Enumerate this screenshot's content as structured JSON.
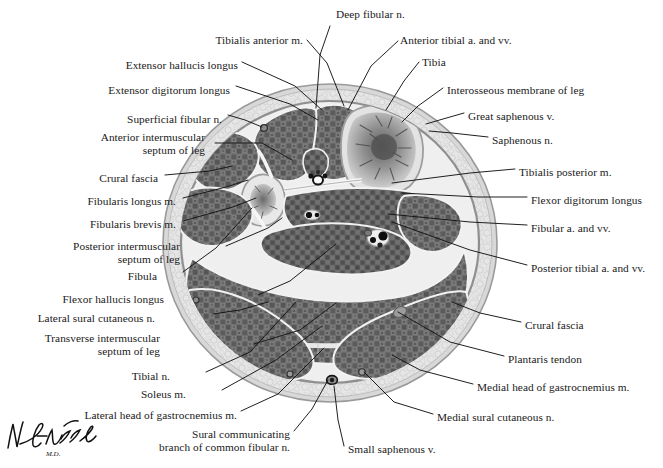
{
  "figure": {
    "credit": "Netter signature",
    "view": "transverse section through middle of right leg",
    "colors": {
      "muscle": "#6d6d6d",
      "muscle_dark": "#4f4f4f",
      "bone_cortex": "#b9b9b9",
      "bone_marrow": "#dadada",
      "marrow_trabecular": "#585858",
      "fascia": "#efefef",
      "subcutaneous": "#e2e2e2",
      "skin": "#cfcfcf",
      "septum": "#f4f4f4",
      "vessel": "#111111",
      "outline": "#6a6a6a",
      "label_text": "#1a1a1a",
      "leader_line": "#111111"
    }
  },
  "labels": [
    {
      "id": "deep-fibular-n",
      "text": "Deep fibular n.",
      "x": 336,
      "y": 8,
      "align": "l"
    },
    {
      "id": "tibialis-anterior-m",
      "text": "Tibialis anterior m.",
      "x": 303,
      "y": 34,
      "align": "r"
    },
    {
      "id": "anterior-tibial-a-vv",
      "text": "Anterior tibial a. and vv.",
      "x": 400,
      "y": 34,
      "align": "l"
    },
    {
      "id": "extensor-hallucis-longus",
      "text": "Extensor hallucis longus",
      "x": 238,
      "y": 59,
      "align": "r"
    },
    {
      "id": "tibia",
      "text": "Tibia",
      "x": 422,
      "y": 56,
      "align": "l"
    },
    {
      "id": "extensor-digitorum-longus",
      "text": "Extensor digitorum longus",
      "x": 230,
      "y": 84,
      "align": "r"
    },
    {
      "id": "interosseous-membrane",
      "text": "Interosseous membrane of leg",
      "x": 447,
      "y": 84,
      "align": "l"
    },
    {
      "id": "superficial-fibular-n",
      "text": "Superficial fibular n.",
      "x": 222,
      "y": 113,
      "align": "r"
    },
    {
      "id": "great-saphenous-v",
      "text": "Great saphenous v.",
      "x": 468,
      "y": 110,
      "align": "l"
    },
    {
      "id": "anterior-intermuscular-septum",
      "text": "Anterior intermuscular\nseptum of leg",
      "x": 205,
      "y": 131,
      "align": "r"
    },
    {
      "id": "saphenous-n",
      "text": "Saphenous n.",
      "x": 492,
      "y": 134,
      "align": "l"
    },
    {
      "id": "crural-fascia-left",
      "text": "Crural fascia",
      "x": 158,
      "y": 172,
      "align": "r"
    },
    {
      "id": "tibialis-posterior-m",
      "text": "Tibialis posterior m.",
      "x": 519,
      "y": 166,
      "align": "l"
    },
    {
      "id": "fibularis-longus-m",
      "text": "Fibularis longus m.",
      "x": 176,
      "y": 195,
      "align": "r"
    },
    {
      "id": "flexor-digitorum-longus",
      "text": "Flexor digitorum longus",
      "x": 531,
      "y": 194,
      "align": "l"
    },
    {
      "id": "fibularis-brevis-m",
      "text": "Fibularis brevis m.",
      "x": 176,
      "y": 218,
      "align": "r"
    },
    {
      "id": "fibular-a-vv",
      "text": "Fibular a. and vv.",
      "x": 531,
      "y": 222,
      "align": "l"
    },
    {
      "id": "posterior-intermuscular-septum",
      "text": "Posterior intermuscular\nseptum of leg",
      "x": 180,
      "y": 240,
      "align": "r"
    },
    {
      "id": "posterior-tibial-a-vv",
      "text": "Posterior tibial a. and vv.",
      "x": 531,
      "y": 262,
      "align": "l"
    },
    {
      "id": "fibula",
      "text": "Fibula",
      "x": 157,
      "y": 270,
      "align": "r"
    },
    {
      "id": "flexor-hallucis-longus",
      "text": "Flexor hallucis longus",
      "x": 164,
      "y": 293,
      "align": "r"
    },
    {
      "id": "lateral-sural-cutaneous-n",
      "text": "Lateral sural cutaneous n.",
      "x": 155,
      "y": 312,
      "align": "r"
    },
    {
      "id": "crural-fascia-right",
      "text": "Crural fascia",
      "x": 525,
      "y": 319,
      "align": "l"
    },
    {
      "id": "transverse-intermuscular-septum",
      "text": "Transverse intermuscular\nseptum of leg",
      "x": 160,
      "y": 332,
      "align": "r"
    },
    {
      "id": "plantaris-tendon",
      "text": "Plantaris tendon",
      "x": 508,
      "y": 353,
      "align": "l"
    },
    {
      "id": "tibial-n",
      "text": "Tibial n.",
      "x": 170,
      "y": 370,
      "align": "r"
    },
    {
      "id": "soleus-m",
      "text": "Soleus m.",
      "x": 186,
      "y": 388,
      "align": "r"
    },
    {
      "id": "medial-head-gastrocnemius",
      "text": "Medial head of gastrocnemius m.",
      "x": 477,
      "y": 381,
      "align": "l"
    },
    {
      "id": "lateral-head-gastrocnemius",
      "text": "Lateral head of gastrocnemius m.",
      "x": 237,
      "y": 409,
      "align": "r"
    },
    {
      "id": "medial-sural-cutaneous-n",
      "text": "Medial sural cutaneous n.",
      "x": 437,
      "y": 411,
      "align": "l"
    },
    {
      "id": "sural-communicating-branch",
      "text": "Sural communicating\nbranch of common fibular n.",
      "x": 290,
      "y": 428,
      "align": "r"
    },
    {
      "id": "small-saphenous-v",
      "text": "Small saphenous v.",
      "x": 348,
      "y": 443,
      "align": "l"
    }
  ],
  "leader_lines": [
    {
      "id": "deep-fibular-n",
      "points": "330,26 320,55 316,108"
    },
    {
      "id": "tibialis-anterior-m",
      "points": "307,40 327,63 344,106"
    },
    {
      "id": "anterior-tibial-a-vv",
      "points": "398,41 371,66 348,110"
    },
    {
      "id": "extensor-hallucis-longus",
      "points": "242,62 295,86 322,110"
    },
    {
      "id": "tibia",
      "points": "419,62 404,81 386,110"
    },
    {
      "id": "extensor-digitorum-longus",
      "points": "236,86 290,104 318,120"
    },
    {
      "id": "interosseous-membrane",
      "points": "443,88 418,106 402,122"
    },
    {
      "id": "superficial-fibular-n",
      "points": "228,115 245,120 262,127"
    },
    {
      "id": "great-saphenous-v",
      "points": "464,113 443,119 426,124"
    },
    {
      "id": "anterior-intermuscular-septum",
      "points": "215,143 262,143 292,160"
    },
    {
      "id": "saphenous-n",
      "points": "488,137 452,133 429,131"
    },
    {
      "id": "crural-fascia-left",
      "points": "165,175 210,171 232,166"
    },
    {
      "id": "tibialis-posterior-m",
      "points": "515,169 470,173 392,183"
    },
    {
      "id": "fibularis-longus-m",
      "points": "183,198 226,187 248,180"
    },
    {
      "id": "flexor-digitorum-longus",
      "points": "527,197 478,197 402,193"
    },
    {
      "id": "fibularis-brevis-m",
      "points": "183,221 233,207 256,198"
    },
    {
      "id": "fibular-a-vv",
      "points": "527,225 470,222 388,214"
    },
    {
      "id": "posterior-intermuscular-septum",
      "points": "226,246 268,228 282,218"
    },
    {
      "id": "posterior-tibial-a-vv",
      "points": "527,265 470,250 392,222"
    },
    {
      "id": "fibula",
      "points": "183,272 216,248 252,208"
    },
    {
      "id": "flexor-hallucis-longus",
      "points": "258,295 290,281 336,244"
    },
    {
      "id": "lateral-sural-cutaneous-n",
      "points": "213,314 240,310 268,302"
    },
    {
      "id": "crural-fascia-right",
      "points": "521,322 480,313 452,302"
    },
    {
      "id": "transverse-intermuscular-septum",
      "points": "254,344 300,330 336,303"
    },
    {
      "id": "plantaris-tendon",
      "points": "504,356 450,342 398,312"
    },
    {
      "id": "tibial-n",
      "points": "206,372 250,352 296,302"
    },
    {
      "id": "soleus-m",
      "points": "222,390 276,360 322,326"
    },
    {
      "id": "medial-head-gastrocnemius",
      "points": "473,384 420,370 392,355"
    },
    {
      "id": "lateral-head-gastrocnemius",
      "points": "241,411 278,394 324,348"
    },
    {
      "id": "medial-sural-cutaneous-n",
      "points": "433,414 394,402 364,372"
    },
    {
      "id": "sural-communicating-branch",
      "points": "294,431 312,409 328,380"
    },
    {
      "id": "small-saphenous-v",
      "points": "344,446 338,420 334,386"
    }
  ]
}
